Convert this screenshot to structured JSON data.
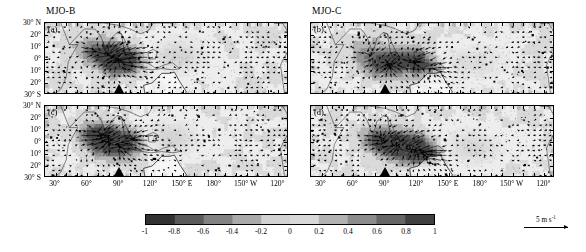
{
  "figure": {
    "columns": [
      {
        "id": "left",
        "title": "MJO-B"
      },
      {
        "id": "right",
        "title": "MJO-C"
      }
    ],
    "panels": [
      {
        "label": "(a)",
        "column": "MJO-B",
        "row": "top"
      },
      {
        "label": "(b)",
        "column": "MJO-C",
        "row": "top"
      },
      {
        "label": "(c)",
        "column": "MJO-B",
        "row": "bottom"
      },
      {
        "label": "(d)",
        "column": "MJO-C",
        "row": "bottom"
      }
    ]
  },
  "axes": {
    "y_ticklabels": [
      "30° N",
      "20°",
      "10°",
      "0°",
      "10°",
      "20°",
      "30° S"
    ],
    "y_values": [
      30,
      20,
      10,
      0,
      -10,
      -20,
      -30
    ],
    "x_ticklabels": [
      "30°",
      "60°",
      "90°",
      "120°",
      "150° E",
      "180°",
      "150° W",
      "120°"
    ],
    "x_values": [
      30,
      60,
      90,
      120,
      150,
      180,
      210,
      240
    ],
    "xlim": [
      20,
      250
    ],
    "ylim": [
      -30,
      30
    ]
  },
  "colorbar": {
    "ticklabels": [
      "-1",
      "-0.8",
      "-0.6",
      "-0.4",
      "-0.2",
      "0",
      "0.2",
      "0.4",
      "0.6",
      "0.8",
      "1"
    ],
    "tickvalues": [
      -1,
      -0.8,
      -0.6,
      -0.4,
      -0.2,
      0,
      0.2,
      0.4,
      0.6,
      0.8,
      1
    ],
    "vmin": -1,
    "vmax": 1,
    "colormap": "grayscale",
    "orientation": "horizontal"
  },
  "reference_vector": {
    "magnitude": "5",
    "units_prefix": " m s",
    "units_exponent": "-1"
  },
  "markers": {
    "bottom_triangle_longitude": 90,
    "count_per_panel": 1
  },
  "chart_data": {
    "type": "heatmap",
    "title": "",
    "xlabel": "",
    "ylabel": "",
    "xlim": [
      20,
      250
    ],
    "ylim": [
      -30,
      30
    ],
    "grid": false,
    "legend": "colorbar-below",
    "colorbar_range": [
      -1,
      1
    ],
    "panels": [
      {
        "name": "(a) MJO-B",
        "seed": 11,
        "convection_centers": [
          [
            88,
            0,
            -0.95
          ],
          [
            78,
            4,
            -0.7
          ],
          [
            100,
            -3,
            -0.55
          ],
          [
            62,
            8,
            -0.35
          ]
        ],
        "westerly_band": [
          120,
          210
        ]
      },
      {
        "name": "(b) MJO-C",
        "seed": 23,
        "convection_centers": [
          [
            95,
            -5,
            -0.9
          ],
          [
            120,
            -2,
            -0.85
          ],
          [
            75,
            2,
            -0.6
          ],
          [
            140,
            -8,
            -0.5
          ]
        ],
        "westerly_band": [
          130,
          215
        ]
      },
      {
        "name": "(c) MJO-B",
        "seed": 37,
        "convection_centers": [
          [
            80,
            0,
            -0.95
          ],
          [
            70,
            6,
            -0.75
          ],
          [
            95,
            -4,
            -0.6
          ],
          [
            110,
            3,
            -0.4
          ]
        ],
        "westerly_band": [
          125,
          205
        ]
      },
      {
        "name": "(d) MJO-C",
        "seed": 53,
        "convection_centers": [
          [
            100,
            -3,
            -0.95
          ],
          [
            118,
            -6,
            -0.85
          ],
          [
            85,
            2,
            -0.7
          ],
          [
            132,
            -10,
            -0.55
          ]
        ],
        "westerly_band": [
          135,
          220
        ]
      }
    ]
  }
}
